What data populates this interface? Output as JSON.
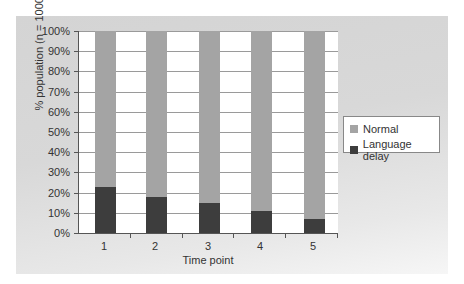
{
  "chart_data": {
    "type": "bar",
    "stacked": true,
    "percent_stacked": true,
    "title": "",
    "xlabel": "Time point",
    "ylabel": "% population (n = 1000)",
    "categories": [
      "1",
      "2",
      "3",
      "4",
      "5"
    ],
    "series": [
      {
        "name": "Language delay",
        "color": "#3d3d3d",
        "values": [
          23,
          18,
          15,
          11,
          7
        ]
      },
      {
        "name": "Normal",
        "color": "#a4a4a4",
        "values": [
          77,
          82,
          85,
          89,
          93
        ]
      }
    ],
    "ylim": [
      0,
      100
    ],
    "yticks": [
      "0%",
      "10%",
      "20%",
      "30%",
      "40%",
      "50%",
      "60%",
      "70%",
      "80%",
      "90%",
      "100%"
    ],
    "grid": true,
    "legend_position": "right"
  },
  "legend": {
    "items": [
      {
        "label": "Normal",
        "color": "#a4a4a4"
      },
      {
        "label": "Language delay",
        "color": "#3d3d3d"
      }
    ]
  }
}
